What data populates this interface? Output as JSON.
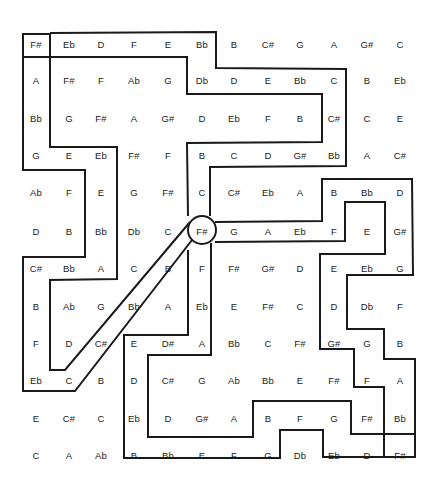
{
  "puzzle": {
    "type": "note-maze",
    "start_note": "F#",
    "end_note": "F#",
    "hub_note": "F#",
    "rows": [
      [
        "F#",
        "Eb",
        "D",
        "F",
        "E",
        "Bb",
        "B",
        "C#",
        "G",
        "A",
        "G#",
        "C"
      ],
      [
        "A",
        "F#",
        "F",
        "Ab",
        "G",
        "Db",
        "D",
        "E",
        "Bb",
        "C",
        "B",
        "Eb"
      ],
      [
        "Bb",
        "G",
        "F#",
        "A",
        "G#",
        "D",
        "Eb",
        "F",
        "B",
        "C#",
        "C",
        "E"
      ],
      [
        "G",
        "E",
        "Eb",
        "F#",
        "F",
        "B",
        "C",
        "D",
        "G#",
        "Bb",
        "A",
        "C#"
      ],
      [
        "Ab",
        "F",
        "E",
        "G",
        "F#",
        "C",
        "C#",
        "Eb",
        "A",
        "B",
        "Bb",
        "D"
      ],
      [
        "D",
        "B",
        "Bb",
        "Db",
        "C",
        "F#",
        "G",
        "A",
        "Eb",
        "F",
        "E",
        "G#"
      ],
      [
        "C#",
        "Bb",
        "A",
        "C",
        "B",
        "F",
        "F#",
        "G#",
        "D",
        "E",
        "Eb",
        "G"
      ],
      [
        "B",
        "Ab",
        "G",
        "Bb",
        "A",
        "Eb",
        "E",
        "F#",
        "C",
        "D",
        "Db",
        "F"
      ],
      [
        "F",
        "D",
        "C#",
        "E",
        "D#",
        "A",
        "Bb",
        "C",
        "F#",
        "G#",
        "G",
        "B"
      ],
      [
        "Eb",
        "C",
        "B",
        "D",
        "C#",
        "G",
        "Ab",
        "Bb",
        "E",
        "F#",
        "F",
        "A"
      ],
      [
        "E",
        "C#",
        "C",
        "Eb",
        "D",
        "G#",
        "A",
        "B",
        "F",
        "G",
        "F#",
        "Bb"
      ],
      [
        "C",
        "A",
        "Ab",
        "B",
        "Bb",
        "E",
        "F",
        "G",
        "Db",
        "Eb",
        "D",
        "F#"
      ]
    ],
    "ink_color": "#1a1a1a",
    "background": "#ffffff"
  }
}
